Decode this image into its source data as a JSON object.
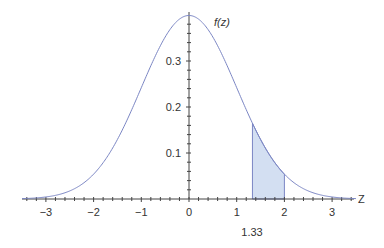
{
  "chart_data": {
    "type": "line",
    "title": "",
    "function_label": "f(z)",
    "xlabel": "Z",
    "ylabel": "f(z)",
    "x_ticks": [
      -3,
      -2,
      -1,
      0,
      1,
      2,
      3
    ],
    "x_tick_labels": [
      "−3",
      "−2",
      "−1",
      "0",
      "1",
      "2",
      "3"
    ],
    "y_ticks": [
      0.1,
      0.2,
      0.3
    ],
    "y_tick_labels": [
      "0.1",
      "0.2",
      "0.3"
    ],
    "xlim": [
      -3.5,
      3.5
    ],
    "ylim": [
      0,
      0.4
    ],
    "grid": false,
    "series": [
      {
        "name": "f(z)",
        "x": [
          -3.5,
          -3,
          -2.5,
          -2,
          -1.5,
          -1,
          -0.5,
          0,
          0.5,
          1,
          1.5,
          2,
          2.5,
          3,
          3.5
        ],
        "values": [
          0.0009,
          0.0044,
          0.0175,
          0.054,
          0.1295,
          0.242,
          0.3521,
          0.3989,
          0.3521,
          0.242,
          0.1295,
          0.054,
          0.0175,
          0.0044,
          0.0009
        ]
      }
    ],
    "shaded_region": {
      "from": 1.33,
      "to": 2,
      "f_from": 0.1647,
      "f_to": 0.054
    },
    "annotations": [
      {
        "text": "1.33",
        "x": 1.33
      }
    ],
    "colors": {
      "curve": "#7b86c4",
      "fill": "#d3dff2",
      "axis": "#444444"
    }
  }
}
